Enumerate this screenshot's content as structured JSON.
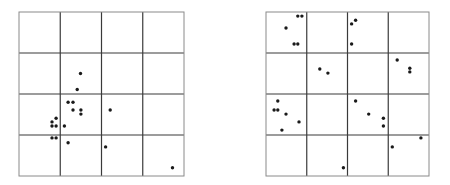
{
  "diagrams": [
    {
      "name": "left-grid",
      "grid": {
        "rows": 4,
        "cols": 4
      },
      "points": [
        [
          1.49,
          1.5
        ],
        [
          1.41,
          1.89
        ],
        [
          1.19,
          2.2
        ],
        [
          1.31,
          2.2
        ],
        [
          1.31,
          2.39
        ],
        [
          1.5,
          2.39
        ],
        [
          1.5,
          2.49
        ],
        [
          2.21,
          2.39
        ],
        [
          0.9,
          2.59
        ],
        [
          0.8,
          2.68
        ],
        [
          0.8,
          2.78
        ],
        [
          0.9,
          2.78
        ],
        [
          1.1,
          2.78
        ],
        [
          0.8,
          3.07
        ],
        [
          0.9,
          3.07
        ],
        [
          1.19,
          3.19
        ],
        [
          2.1,
          3.29
        ],
        [
          3.72,
          3.8
        ]
      ]
    },
    {
      "name": "right-grid",
      "grid": {
        "rows": 4,
        "cols": 4
      },
      "points": [
        [
          0.78,
          0.1
        ],
        [
          0.88,
          0.1
        ],
        [
          0.49,
          0.39
        ],
        [
          0.69,
          0.78
        ],
        [
          0.78,
          0.78
        ],
        [
          2.2,
          0.2
        ],
        [
          2.1,
          0.29
        ],
        [
          2.1,
          0.78
        ],
        [
          1.32,
          1.39
        ],
        [
          1.52,
          1.49
        ],
        [
          3.22,
          1.17
        ],
        [
          3.53,
          1.37
        ],
        [
          3.53,
          1.46
        ],
        [
          0.29,
          2.17
        ],
        [
          0.2,
          2.39
        ],
        [
          0.29,
          2.39
        ],
        [
          0.49,
          2.49
        ],
        [
          0.81,
          2.68
        ],
        [
          0.39,
          2.88
        ],
        [
          2.2,
          2.17
        ],
        [
          2.52,
          2.49
        ],
        [
          2.88,
          2.59
        ],
        [
          2.88,
          2.78
        ],
        [
          3.8,
          3.07
        ],
        [
          3.1,
          3.29
        ],
        [
          1.9,
          3.8
        ]
      ]
    }
  ],
  "colors": {
    "outer_border": "#8a8a8a",
    "inner_line": "#3a3a3a",
    "dot": "#1a1a1a",
    "background": "#ffffff"
  }
}
